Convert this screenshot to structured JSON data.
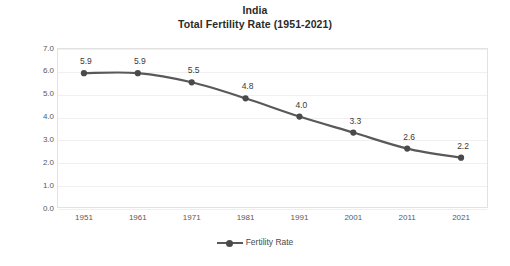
{
  "chart_data": {
    "type": "line",
    "title": "India\nTotal Fertility Rate (1951-2021)",
    "title_line1": "India",
    "title_line2": "Total Fertility Rate (1951-2021)",
    "xlabel": "",
    "ylabel": "Total Fertility Rate",
    "categories": [
      "1951",
      "1961",
      "1971",
      "1981",
      "1991",
      "2001",
      "2011",
      "2021"
    ],
    "values": [
      5.9,
      5.9,
      5.5,
      4.8,
      4.0,
      3.3,
      2.6,
      2.2
    ],
    "data_labels": [
      "5.9",
      "5.9",
      "5.5",
      "4.8",
      "4.0",
      "3.3",
      "2.6",
      "2.2"
    ],
    "series": [
      {
        "name": "Fertility Rate",
        "values": [
          5.9,
          5.9,
          5.5,
          4.8,
          4.0,
          3.3,
          2.6,
          2.2
        ],
        "color": "#595959",
        "marker": "circle",
        "smooth": true
      }
    ],
    "ylim": [
      0.0,
      7.0
    ],
    "ytick_step": 1.0,
    "yticks": [
      "7.0",
      "6.0",
      "5.0",
      "4.0",
      "3.0",
      "2.0",
      "1.0",
      "0.0"
    ],
    "ytick_values": [
      7.0,
      6.0,
      5.0,
      4.0,
      3.0,
      2.0,
      1.0,
      0.0
    ],
    "xticks": [
      "1951",
      "1961",
      "1971",
      "1981",
      "1991",
      "2001",
      "2011",
      "2021"
    ],
    "grid": {
      "horizontal": true,
      "vertical": false,
      "color": "#f0f0f0"
    },
    "legend": {
      "position": "bottom",
      "entries": [
        {
          "label": "Fertility Rate",
          "color": "#595959",
          "marker": "circle"
        }
      ]
    },
    "colors": {
      "line": "#595959",
      "marker": "#4a4a4a",
      "plot_border": "#e2e2e2",
      "gridline": "#f0f0f0",
      "axis_text": "#595959",
      "title_text": "#2b2b2b",
      "data_label_text": "#3a3a3a",
      "background": "#ffffff"
    }
  }
}
